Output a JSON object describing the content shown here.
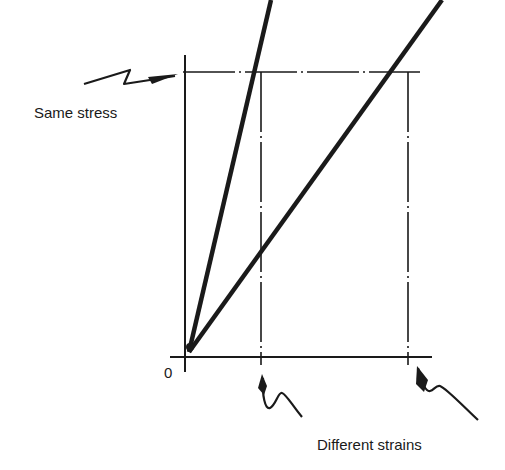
{
  "diagram": {
    "type": "stress-strain comparison",
    "labels": {
      "stress": "Same stress",
      "strains": "Different strains",
      "origin": "0"
    },
    "lines": [
      {
        "name": "stiff-material-line",
        "from": [
          188,
          352
        ],
        "to": [
          272,
          0
        ]
      },
      {
        "name": "flexible-material-line",
        "from": [
          188,
          352
        ],
        "to": [
          443,
          0
        ]
      }
    ],
    "colors": {
      "ink": "#1a1a1a",
      "background": "#ffffff"
    }
  }
}
